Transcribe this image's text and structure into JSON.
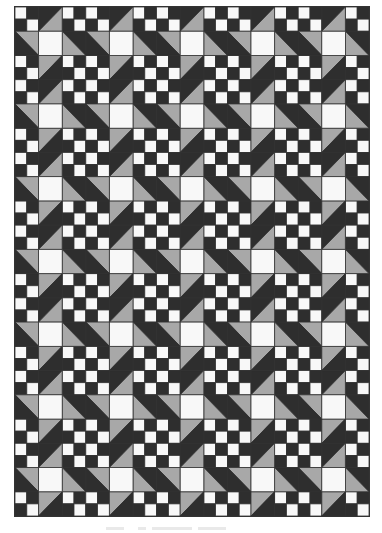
{
  "figure": {
    "type": "quilt-pattern",
    "layout": {
      "blocks_across": 5,
      "blocks_down": 7,
      "block_grid": 3
    },
    "colors": {
      "dark": "#2e2e2e",
      "medium": "#a8a8a8",
      "light": "#f8f8f8",
      "seam": "#333333"
    },
    "block": {
      "corners": {
        "description": "four-patch",
        "top_left": "light",
        "top_right": "dark",
        "bottom_left": "dark",
        "bottom_right": "light"
      },
      "center": "light",
      "sides": {
        "top": {
          "shape": "half-square-triangle",
          "diagonal": "bl-tr",
          "upper": "dark",
          "lower": "medium"
        },
        "bottom": {
          "shape": "half-square-triangle",
          "diagonal": "bl-tr",
          "upper": "medium",
          "lower": "dark"
        },
        "left": {
          "shape": "half-square-triangle",
          "diagonal": "tl-br",
          "upper": "medium",
          "lower": "dark"
        },
        "right": {
          "shape": "half-square-triangle",
          "diagonal": "tl-br",
          "upper": "dark",
          "lower": "medium"
        }
      }
    }
  }
}
